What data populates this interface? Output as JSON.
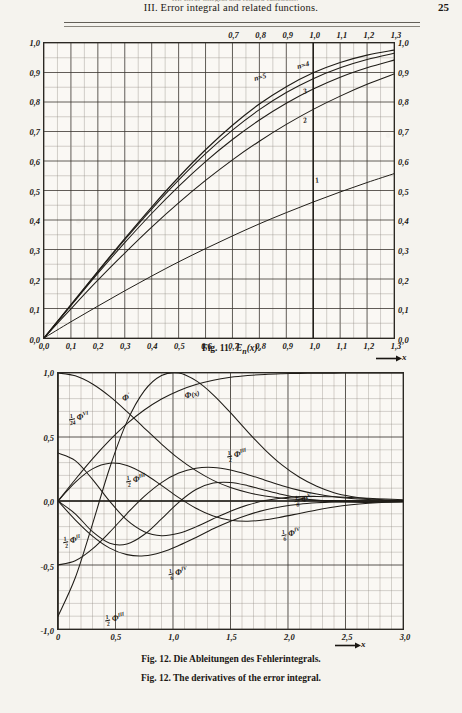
{
  "page": {
    "running_head": "III. Error integral and related functions.",
    "page_number": "25",
    "ghost_text": "III. Error integral and related functions."
  },
  "figure1": {
    "caption_prefix": "Fig. 11.",
    "caption_function": "E",
    "caption_sub": "n",
    "caption_arg": "(x)",
    "x_axis_arrow_label": "x",
    "y_labels": [
      "1,0",
      "0,9",
      "0,8",
      "0,7",
      "0,6",
      "0,5",
      "0,4",
      "0,3",
      "0,2",
      "0,1",
      "0,0"
    ],
    "x_labels_bottom": [
      "0,0",
      "0,1",
      "0,2",
      "0,3",
      "0,4",
      "0,5",
      "0,6",
      "0,7",
      "0,8",
      "0,9",
      "1,0",
      "1,1",
      "1,2",
      "1,3"
    ],
    "x_labels_top": [
      "0,7",
      "0,8",
      "0,9",
      "1,0",
      "1,1",
      "1,2",
      "1,3"
    ],
    "curve_labels": [
      {
        "text": "n=5",
        "x": 0.615,
        "y": 0.885
      },
      {
        "text": "n=4",
        "x": 0.735,
        "y": 0.925
      },
      {
        "text": "3",
        "x": 0.742,
        "y": 0.838
      },
      {
        "text": "2",
        "x": 0.742,
        "y": 0.742
      },
      {
        "text": "1",
        "x": 0.775,
        "y": 0.54
      }
    ]
  },
  "figure2": {
    "caption_de": "Fig. 12. Die Ableitungen des Fehlerintegrals.",
    "caption_en": "Fig. 12. The derivatives of the error integral.",
    "x_axis_arrow_label": "x",
    "y_labels": [
      "1,0",
      "0,5",
      "0,0",
      "-0,5",
      "-1,0"
    ],
    "x_labels": [
      "0",
      "0,5",
      "1,0",
      "1,5",
      "2,0",
      "2,5",
      "3,0"
    ],
    "curve_labels": [
      {
        "id": "phi-x",
        "num": "",
        "den": "",
        "sym": "Φ",
        "sup": "",
        "extra": "(x)",
        "x": 0.385,
        "y": 0.082
      },
      {
        "id": "phi-1",
        "num": "",
        "den": "",
        "sym": "Φ",
        "sup": "′",
        "extra": "",
        "x": 0.197,
        "y": 0.092
      },
      {
        "id": "phi-6",
        "num": "1",
        "den": "24",
        "sym": "Φ",
        "sup": "VI",
        "extra": "",
        "x": 0.06,
        "y": 0.175
      },
      {
        "id": "phi-3a",
        "num": "1",
        "den": "2",
        "sym": "Φ",
        "sup": "III",
        "extra": "",
        "x": 0.225,
        "y": 0.415
      },
      {
        "id": "phi-3b",
        "num": "1",
        "den": "2",
        "sym": "Φ",
        "sup": "III",
        "extra": "",
        "x": 0.515,
        "y": 0.318
      },
      {
        "id": "phi-2",
        "num": "1",
        "den": "2",
        "sym": "Φ",
        "sup": "II",
        "extra": "",
        "x": 0.04,
        "y": 0.65
      },
      {
        "id": "phi-5",
        "num": "1",
        "den": "8",
        "sym": "Φ",
        "sup": "V",
        "extra": "",
        "x": 0.705,
        "y": 0.492
      },
      {
        "id": "phi-4",
        "num": "1",
        "den": "6",
        "sym": "Φ",
        "sup": "IV",
        "extra": "",
        "x": 0.672,
        "y": 0.625
      },
      {
        "id": "phi-4b",
        "num": "1",
        "den": "6",
        "sym": "Φ",
        "sup": "IV",
        "extra": "",
        "x": 0.345,
        "y": 0.775
      },
      {
        "id": "phi-3c",
        "num": "1",
        "den": "2",
        "sym": "Φ",
        "sup": "III",
        "extra": "",
        "x": 0.165,
        "y": 0.955
      }
    ]
  },
  "chart_data": [
    {
      "type": "line",
      "title": "Fig. 11. E_n(x)",
      "xlabel": "x",
      "ylabel": "",
      "xlim": [
        0.0,
        1.3
      ],
      "ylim": [
        0.0,
        1.0
      ],
      "xticks": [
        0.0,
        0.1,
        0.2,
        0.3,
        0.4,
        0.5,
        0.6,
        0.7,
        0.8,
        0.9,
        1.0,
        1.1,
        1.2,
        1.3
      ],
      "yticks": [
        0.0,
        0.1,
        0.2,
        0.3,
        0.4,
        0.5,
        0.6,
        0.7,
        0.8,
        0.9,
        1.0
      ],
      "grid": true,
      "legend": "inline-curve-labels",
      "x": [
        0.0,
        0.1,
        0.2,
        0.3,
        0.4,
        0.5,
        0.6,
        0.7,
        0.8,
        0.9,
        1.0,
        1.1,
        1.2,
        1.3
      ],
      "series": [
        {
          "name": "n=1",
          "values": [
            0.0,
            0.055,
            0.108,
            0.16,
            0.21,
            0.258,
            0.303,
            0.346,
            0.387,
            0.425,
            0.461,
            0.495,
            0.527,
            0.557
          ]
        },
        {
          "name": "n=2",
          "values": [
            0.0,
            0.099,
            0.196,
            0.288,
            0.376,
            0.458,
            0.534,
            0.604,
            0.667,
            0.724,
            0.775,
            0.82,
            0.86,
            0.895
          ]
        },
        {
          "name": "3",
          "values": [
            0.0,
            0.11,
            0.219,
            0.323,
            0.422,
            0.514,
            0.598,
            0.673,
            0.739,
            0.796,
            0.844,
            0.884,
            0.916,
            0.942
          ]
        },
        {
          "name": "4",
          "values": [
            0.0,
            0.112,
            0.224,
            0.333,
            0.437,
            0.535,
            0.625,
            0.705,
            0.774,
            0.832,
            0.879,
            0.916,
            0.944,
            0.965
          ]
        },
        {
          "name": "5",
          "values": [
            0.0,
            0.113,
            0.226,
            0.337,
            0.444,
            0.545,
            0.638,
            0.721,
            0.793,
            0.852,
            0.899,
            0.934,
            0.959,
            0.976
          ]
        }
      ]
    },
    {
      "type": "line",
      "title": "Fig. 12. The derivatives of the error integral.",
      "xlabel": "x",
      "ylabel": "",
      "xlim": [
        0.0,
        3.0
      ],
      "ylim": [
        -1.0,
        1.0
      ],
      "xticks": [
        0.0,
        0.5,
        1.0,
        1.5,
        2.0,
        2.5,
        3.0
      ],
      "yticks": [
        -1.0,
        -0.5,
        0.0,
        0.5,
        1.0
      ],
      "grid": true,
      "legend": "inline-curve-labels",
      "x": [
        0.0,
        0.15,
        0.3,
        0.45,
        0.6,
        0.75,
        0.9,
        1.05,
        1.2,
        1.35,
        1.5,
        1.65,
        1.8,
        1.95,
        2.1,
        2.25,
        2.4,
        2.55,
        2.7,
        2.85,
        3.0
      ],
      "series": [
        {
          "name": "Φ(x)",
          "values": [
            0.0,
            0.168,
            0.329,
            0.475,
            0.604,
            0.711,
            0.797,
            0.862,
            0.91,
            0.944,
            0.966,
            0.98,
            0.989,
            0.994,
            0.997,
            0.999,
            0.999,
            1.0,
            1.0,
            1.0,
            1.0
          ]
        },
        {
          "name": "Φ′",
          "values": [
            1.0,
            0.978,
            0.914,
            0.817,
            0.698,
            0.57,
            0.445,
            0.331,
            0.237,
            0.161,
            0.105,
            0.066,
            0.039,
            0.022,
            0.012,
            0.006,
            0.003,
            0.001,
            0.001,
            0.0,
            0.0
          ]
        },
        {
          "name": "1/2 Φ''",
          "values": [
            0.0,
            -0.147,
            -0.274,
            -0.368,
            -0.419,
            -0.428,
            -0.4,
            -0.348,
            -0.285,
            -0.217,
            -0.158,
            -0.109,
            -0.07,
            -0.043,
            -0.025,
            -0.014,
            -0.007,
            -0.003,
            -0.002,
            -0.001,
            0.0
          ]
        },
        {
          "name": "1/2 ΦIII",
          "values": [
            -0.5,
            -0.467,
            -0.374,
            -0.243,
            -0.098,
            0.036,
            0.144,
            0.218,
            0.256,
            0.262,
            0.242,
            0.206,
            0.163,
            0.12,
            0.083,
            0.054,
            0.033,
            0.019,
            0.011,
            0.006,
            0.003
          ]
        },
        {
          "name": "1/6 ΦIV",
          "values": [
            0.0,
            0.146,
            0.251,
            0.295,
            0.278,
            0.213,
            0.122,
            0.026,
            -0.057,
            -0.117,
            -0.15,
            -0.158,
            -0.147,
            -0.124,
            -0.097,
            -0.07,
            -0.047,
            -0.03,
            -0.018,
            -0.01,
            -0.006
          ]
        },
        {
          "name": "1/8 ΦV",
          "values": [
            0.375,
            0.316,
            0.169,
            -0.003,
            -0.15,
            -0.24,
            -0.271,
            -0.252,
            -0.202,
            -0.139,
            -0.08,
            -0.031,
            0.003,
            0.024,
            0.034,
            0.036,
            0.033,
            0.027,
            0.021,
            0.015,
            0.01
          ]
        },
        {
          "name": "1/24 ΦVI",
          "values": [
            0.0,
            -0.1,
            -0.24,
            -0.33,
            -0.336,
            -0.262,
            -0.14,
            -0.01,
            0.09,
            0.14,
            0.145,
            0.12,
            0.084,
            0.05,
            0.023,
            0.005,
            -0.005,
            -0.01,
            -0.011,
            -0.009,
            -0.007
          ]
        },
        {
          "name": "1/2 ΦIII-b",
          "values": [
            -0.9,
            -0.6,
            -0.18,
            0.26,
            0.62,
            0.86,
            0.98,
            1.0,
            0.94,
            0.83,
            0.69,
            0.54,
            0.4,
            0.28,
            0.185,
            0.115,
            0.065,
            0.035,
            0.017,
            0.008,
            0.003
          ]
        }
      ]
    }
  ]
}
